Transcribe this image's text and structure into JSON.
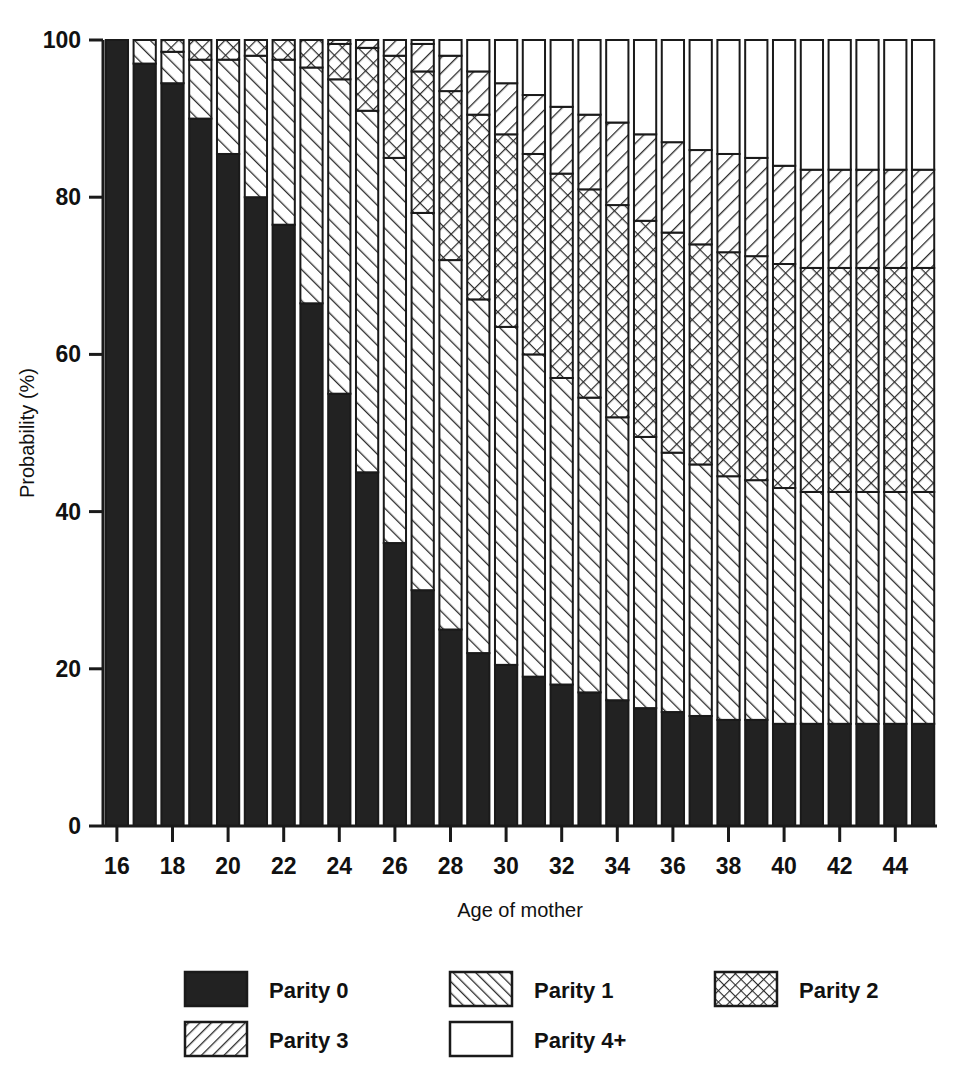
{
  "chart_data": {
    "type": "bar",
    "subtype": "stacked-bar-100-percent",
    "title": "",
    "xlabel": "Age of mother",
    "ylabel": "Probability (%)",
    "ylim": [
      0,
      100
    ],
    "ytick_labels": [
      "0",
      "20",
      "40",
      "60",
      "80",
      "100"
    ],
    "yticks": [
      0,
      20,
      40,
      60,
      80,
      100
    ],
    "xtick_labels": [
      "16",
      "18",
      "20",
      "22",
      "24",
      "26",
      "28",
      "30",
      "32",
      "34",
      "36",
      "38",
      "40",
      "42",
      "44"
    ],
    "xticks": [
      16,
      18,
      20,
      22,
      24,
      26,
      28,
      30,
      32,
      34,
      36,
      38,
      40,
      42,
      44
    ],
    "xlim": [
      15.5,
      45.5
    ],
    "grid": false,
    "legend_position": "below-axes",
    "categories": [
      16,
      17,
      18,
      19,
      20,
      21,
      22,
      23,
      24,
      25,
      26,
      27,
      28,
      29,
      30,
      31,
      32,
      33,
      34,
      35,
      36,
      37,
      38,
      39,
      40,
      41,
      42,
      43,
      44,
      45
    ],
    "series": [
      {
        "name": "Parity 0",
        "pattern": "solid-black",
        "values": [
          100,
          97,
          94.5,
          90,
          85.5,
          80,
          76.5,
          66.5,
          55,
          45,
          36,
          30,
          25,
          22,
          20.5,
          19,
          18,
          17,
          16,
          15,
          14.5,
          14,
          13.5,
          13.5,
          13,
          13,
          13,
          13,
          13,
          13
        ]
      },
      {
        "name": "Parity 1",
        "pattern": "diagonal-forward-hatch",
        "values": [
          0,
          3,
          4,
          7.5,
          12,
          18,
          21,
          30,
          40,
          46,
          49,
          48,
          47,
          45,
          43,
          41,
          39,
          37.5,
          36,
          34.5,
          33,
          32,
          31,
          30.5,
          30,
          29.5,
          29.5,
          29.5,
          29.5,
          29.5
        ]
      },
      {
        "name": "Parity 2",
        "pattern": "crosshatch",
        "values": [
          0,
          0,
          1.5,
          2.5,
          2.5,
          2,
          2.5,
          3.5,
          4.5,
          8,
          13,
          18,
          21.5,
          23.5,
          24.5,
          25.5,
          26,
          26.5,
          27,
          27.5,
          28,
          28,
          28.5,
          28.5,
          28.5,
          28.5,
          28.5,
          28.5,
          28.5,
          28.5
        ]
      },
      {
        "name": "Parity 3",
        "pattern": "diagonal-backward-hatch",
        "values": [
          0,
          0,
          0,
          0,
          0,
          0,
          0,
          0,
          0.5,
          1,
          2,
          3.5,
          4.5,
          5.5,
          6.5,
          7.5,
          8.5,
          9.5,
          10.5,
          11,
          11.5,
          12,
          12.5,
          12.5,
          12.5,
          12.5,
          12.5,
          12.5,
          12.5,
          12.5
        ]
      },
      {
        "name": "Parity 4+",
        "pattern": "empty-white",
        "values": [
          0,
          0,
          0,
          0,
          0,
          0,
          0,
          0,
          0,
          0,
          0,
          0.5,
          2,
          4,
          5.5,
          7,
          8.5,
          9.5,
          10.5,
          12,
          13,
          14,
          14.5,
          15,
          16,
          16.5,
          16.5,
          16.5,
          16.5,
          16.5
        ]
      }
    ]
  },
  "legend": {
    "items": [
      {
        "label": "Parity 0",
        "pattern": "solid-black"
      },
      {
        "label": "Parity 1",
        "pattern": "diagonal-forward-hatch"
      },
      {
        "label": "Parity 2",
        "pattern": "crosshatch"
      },
      {
        "label": "Parity 3",
        "pattern": "diagonal-backward-hatch"
      },
      {
        "label": "Parity 4+",
        "pattern": "empty-white"
      }
    ]
  },
  "colors": {
    "ink": "#1a1a1a",
    "background": "#ffffff",
    "fill_solid": "#222222",
    "hatch_line": "#333333"
  }
}
